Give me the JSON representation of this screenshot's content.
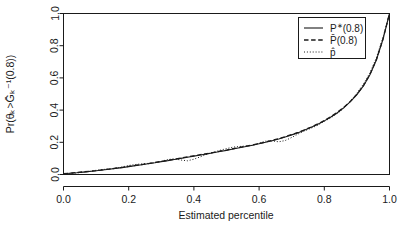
{
  "chart_data": {
    "type": "line",
    "title": "",
    "subtitle": "",
    "xlabel": "Estimated percentile",
    "ylabel": "Pr(θₖ>Ḡₖ⁻¹(0.8))",
    "xlim": [
      0.0,
      1.0
    ],
    "ylim": [
      0.0,
      1.0
    ],
    "grid": false,
    "legend_position": "top-right",
    "xticks": [
      "0.0",
      "0.2",
      "0.4",
      "0.6",
      "0.8",
      "1.0"
    ],
    "xtick_values": [
      0.0,
      0.2,
      0.4,
      0.6,
      0.8,
      1.0
    ],
    "yticks": [
      "0.0",
      "0.2",
      "0.4",
      "0.6",
      "0.8",
      "1.0"
    ],
    "ytick_values": [
      0.0,
      0.2,
      0.4,
      0.6,
      0.8,
      1.0
    ],
    "x": [
      0.0,
      0.02,
      0.04,
      0.06,
      0.08,
      0.1,
      0.12,
      0.14,
      0.16,
      0.18,
      0.2,
      0.22,
      0.24,
      0.26,
      0.28,
      0.3,
      0.32,
      0.34,
      0.36,
      0.38,
      0.4,
      0.42,
      0.44,
      0.46,
      0.48,
      0.5,
      0.52,
      0.54,
      0.56,
      0.58,
      0.6,
      0.62,
      0.64,
      0.66,
      0.68,
      0.7,
      0.72,
      0.74,
      0.76,
      0.78,
      0.8,
      0.82,
      0.84,
      0.86,
      0.88,
      0.9,
      0.92,
      0.94,
      0.96,
      0.98,
      1.0
    ],
    "series": [
      {
        "name": "P*(0.8)",
        "label_base": "P",
        "label_sup": "∗",
        "label_tail": "(0.8)",
        "style": "solid",
        "color": "#1a1a1a",
        "values": [
          0.005,
          0.008,
          0.011,
          0.015,
          0.019,
          0.023,
          0.028,
          0.033,
          0.038,
          0.043,
          0.049,
          0.055,
          0.061,
          0.067,
          0.073,
          0.08,
          0.086,
          0.093,
          0.1,
          0.107,
          0.114,
          0.121,
          0.128,
          0.135,
          0.143,
          0.15,
          0.158,
          0.166,
          0.174,
          0.182,
          0.191,
          0.2,
          0.21,
          0.221,
          0.233,
          0.246,
          0.26,
          0.276,
          0.293,
          0.312,
          0.333,
          0.357,
          0.384,
          0.415,
          0.452,
          0.496,
          0.55,
          0.62,
          0.713,
          0.84,
          1.0
        ]
      },
      {
        "name": "P̅(0.8)",
        "label_base": "P̄",
        "label_sup": "",
        "label_tail": "(0.8)",
        "style": "dashed",
        "color": "#1a1a1a",
        "values": [
          0.005,
          0.008,
          0.012,
          0.016,
          0.02,
          0.024,
          0.029,
          0.034,
          0.039,
          0.044,
          0.05,
          0.056,
          0.062,
          0.068,
          0.075,
          0.081,
          0.088,
          0.095,
          0.102,
          0.109,
          0.116,
          0.123,
          0.13,
          0.137,
          0.145,
          0.152,
          0.16,
          0.168,
          0.176,
          0.184,
          0.193,
          0.202,
          0.212,
          0.223,
          0.235,
          0.248,
          0.262,
          0.278,
          0.295,
          0.314,
          0.335,
          0.359,
          0.386,
          0.417,
          0.454,
          0.498,
          0.552,
          0.622,
          0.714,
          0.841,
          1.0
        ]
      },
      {
        "name": "p̂",
        "label_base": "p̂",
        "label_sup": "",
        "label_tail": "",
        "style": "dotted",
        "color": "#1a1a1a",
        "values": [
          0.004,
          0.007,
          0.01,
          0.014,
          0.02,
          0.026,
          0.031,
          0.034,
          0.039,
          0.047,
          0.056,
          0.062,
          0.066,
          0.069,
          0.073,
          0.082,
          0.093,
          0.097,
          0.09,
          0.085,
          0.095,
          0.11,
          0.126,
          0.138,
          0.15,
          0.161,
          0.17,
          0.174,
          0.177,
          0.182,
          0.195,
          0.207,
          0.209,
          0.203,
          0.211,
          0.23,
          0.252,
          0.271,
          0.288,
          0.306,
          0.33,
          0.352,
          0.379,
          0.411,
          0.455,
          0.505,
          0.562,
          0.632,
          0.726,
          0.852,
          0.995
        ]
      }
    ]
  }
}
